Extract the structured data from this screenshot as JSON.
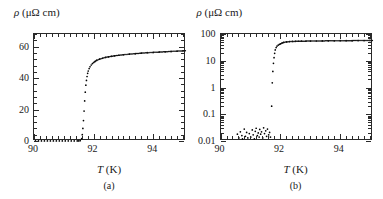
{
  "figure": {
    "panels": [
      {
        "id": "a",
        "caption": "(a)",
        "y_axis_label_rho": "ρ",
        "y_axis_label_unit": "(μΩ cm)",
        "x_axis_label_symbol": "T",
        "x_axis_label_unit": "(K)",
        "y_tick_labels": [
          "0",
          "20",
          "40",
          "60"
        ],
        "x_tick_labels": [
          "90",
          "92",
          "94"
        ]
      },
      {
        "id": "b",
        "caption": "(b)",
        "y_axis_label_rho": "ρ",
        "y_axis_label_unit": "(μΩ cm)",
        "x_axis_label_symbol": "T",
        "x_axis_label_unit": "(K)",
        "y_tick_labels": [
          "0.01",
          "0.1",
          "1",
          "10",
          "100"
        ],
        "x_tick_labels": [
          "90",
          "92",
          "94"
        ]
      }
    ]
  },
  "chart_data": [
    {
      "type": "scatter",
      "panel": "a",
      "title": "",
      "xlabel": "T (K)",
      "ylabel": "ρ (μΩ cm)",
      "xlim": [
        90,
        95.1
      ],
      "ylim": [
        0,
        68
      ],
      "yscale": "linear",
      "xscale": "linear",
      "xticks": [
        90,
        92,
        94
      ],
      "yticks": [
        0,
        20,
        40,
        60
      ],
      "xminor_step": 0.2,
      "yminor_step": 4,
      "grid": false,
      "legend": null,
      "annotation": "(a)",
      "x": [
        90.05,
        90.15,
        90.25,
        90.35,
        90.45,
        90.55,
        90.65,
        90.75,
        90.85,
        90.95,
        91.05,
        91.15,
        91.25,
        91.35,
        91.45,
        91.5,
        91.55,
        91.6,
        91.62,
        91.64,
        91.66,
        91.68,
        91.7,
        91.72,
        91.74,
        91.76,
        91.78,
        91.8,
        91.82,
        91.85,
        91.88,
        91.92,
        91.96,
        92.0,
        92.05,
        92.1,
        92.2,
        92.3,
        92.4,
        92.5,
        92.6,
        92.7,
        92.85,
        93.0,
        93.2,
        93.4,
        93.6,
        93.8,
        94.0,
        94.2,
        94.4,
        94.6,
        94.8,
        95.0
      ],
      "y": [
        0.02,
        0.02,
        0.02,
        0.02,
        0.02,
        0.02,
        0.02,
        0.02,
        0.02,
        0.02,
        0.02,
        0.02,
        0.02,
        0.02,
        0.03,
        0.05,
        0.2,
        1.5,
        4.0,
        8.0,
        13.0,
        19.0,
        25.5,
        31.0,
        35.5,
        38.5,
        41.0,
        43.0,
        44.5,
        46.0,
        47.2,
        48.3,
        49.2,
        49.9,
        50.6,
        51.2,
        52.0,
        52.6,
        53.1,
        53.5,
        53.8,
        54.1,
        54.5,
        54.8,
        55.2,
        55.5,
        55.8,
        56.1,
        56.3,
        56.5,
        56.7,
        56.9,
        57.1,
        57.3
      ]
    },
    {
      "type": "scatter",
      "panel": "b",
      "title": "",
      "xlabel": "T (K)",
      "ylabel": "ρ (μΩ cm)",
      "xlim": [
        90,
        95.1
      ],
      "ylim": [
        0.01,
        100
      ],
      "yscale": "log",
      "xscale": "linear",
      "xticks": [
        90,
        92,
        94
      ],
      "yticks": [
        0.01,
        0.1,
        1,
        10,
        100
      ],
      "xminor_step": 0.2,
      "grid": false,
      "legend": null,
      "annotation": "(b)",
      "x": [
        90.55,
        90.6,
        90.65,
        90.7,
        90.72,
        90.78,
        90.82,
        90.86,
        90.9,
        90.95,
        91.0,
        91.05,
        91.08,
        91.12,
        91.15,
        91.18,
        91.22,
        91.25,
        91.28,
        91.3,
        91.33,
        91.36,
        91.4,
        91.43,
        91.46,
        91.5,
        91.53,
        91.56,
        91.6,
        91.63,
        91.66,
        91.7,
        91.72,
        91.74,
        91.76,
        91.78,
        91.8,
        91.82,
        91.85,
        91.88,
        91.92,
        91.96,
        92.0,
        92.05,
        92.1,
        92.2,
        92.3,
        92.4,
        92.5,
        92.6,
        92.7,
        92.85,
        93.0,
        93.2,
        93.4,
        93.6,
        93.8,
        94.0,
        94.2,
        94.4,
        94.6,
        94.8,
        95.0
      ],
      "y": [
        0.018,
        0.013,
        0.022,
        0.016,
        0.012,
        0.028,
        0.015,
        0.021,
        0.013,
        0.019,
        0.014,
        0.026,
        0.017,
        0.012,
        0.023,
        0.03,
        0.016,
        0.02,
        0.014,
        0.027,
        0.018,
        0.022,
        0.013,
        0.031,
        0.019,
        0.024,
        0.015,
        0.028,
        0.017,
        0.021,
        0.014,
        0.2,
        1.5,
        4.0,
        8.0,
        13.0,
        19.0,
        25.5,
        31.0,
        35.5,
        38.5,
        41.0,
        43.0,
        46.0,
        48.3,
        50.6,
        52.0,
        52.6,
        53.1,
        53.5,
        53.8,
        54.1,
        54.5,
        54.8,
        55.2,
        55.5,
        55.8,
        56.1,
        56.3,
        56.5,
        56.7,
        56.9,
        57.3
      ]
    }
  ]
}
